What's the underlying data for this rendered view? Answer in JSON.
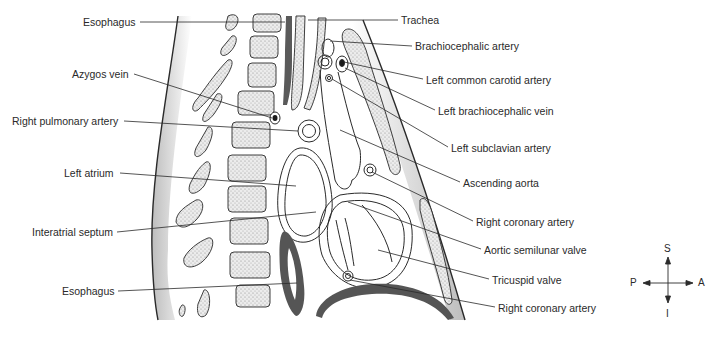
{
  "figure": {
    "background": "#ffffff",
    "line_color": "#2a2a2a",
    "fill_dark": "#555555",
    "fill_stipple": "#e4e4e4"
  },
  "labels_left": [
    {
      "text": "Esophagus",
      "x": 83,
      "y": 17
    },
    {
      "text": "Azygos vein",
      "x": 72,
      "y": 67
    },
    {
      "text": "Right pulmonary artery",
      "x": 12,
      "y": 116
    },
    {
      "text": "Left atrium",
      "x": 64,
      "y": 166
    },
    {
      "text": "Interatrial septum",
      "x": 32,
      "y": 226
    },
    {
      "text": "Esophagus",
      "x": 62,
      "y": 284
    }
  ],
  "labels_right": [
    {
      "text": "Trachea",
      "x": 401,
      "y": 14
    },
    {
      "text": "Brachiocephalic artery",
      "x": 415,
      "y": 40
    },
    {
      "text": "Left common carotid artery",
      "x": 426,
      "y": 73
    },
    {
      "text": "Left brachiocephalic vein",
      "x": 438,
      "y": 104
    },
    {
      "text": "Left subclavian artery",
      "x": 451,
      "y": 141
    },
    {
      "text": "Ascending aorta",
      "x": 463,
      "y": 176
    },
    {
      "text": "Right coronary artery",
      "x": 476,
      "y": 215
    },
    {
      "text": "Aortic semilunar valve",
      "x": 484,
      "y": 243
    },
    {
      "text": "Tricuspid valve",
      "x": 492,
      "y": 273
    },
    {
      "text": "Right coronary artery",
      "x": 498,
      "y": 301
    }
  ],
  "compass": {
    "superior": "S",
    "inferior": "I",
    "posterior": "P",
    "anterior": "A"
  }
}
